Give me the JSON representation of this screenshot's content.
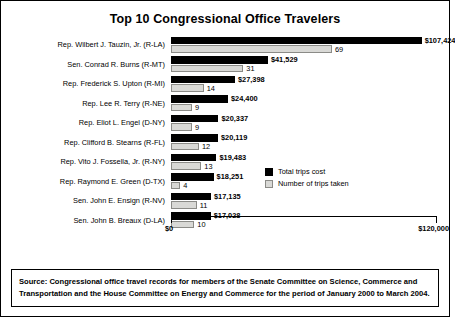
{
  "chart_data": {
    "type": "bar",
    "title": "Top 10 Congressional Office Travelers",
    "xlabel": "",
    "ylabel": "",
    "orientation": "horizontal",
    "xlim": [
      0,
      120000
    ],
    "grid": false,
    "legend_position": "inside-right",
    "axis_ticks": [
      "$0",
      "$120,000"
    ],
    "categories": [
      "Rep. Wilbert J. Tauzin, Jr. (R-LA)",
      "Sen. Conrad R. Burns (R-MT)",
      "Rep. Frederick S. Upton (R-MI)",
      "Rep. Lee R. Terry (R-NE)",
      "Rep. Eliot L. Engel (D-NY)",
      "Rep. Clifford B. Stearns (R-FL)",
      "Rep. Vito J. Fossella, Jr. (R-NY)",
      "Rep. Raymond E. Green (D-TX)",
      "Sen. John E. Ensign (R-NV)",
      "Sen. John B. Breaux (D-LA)"
    ],
    "series": [
      {
        "name": "Total trips cost",
        "color": "#000000",
        "values": [
          107424,
          41529,
          27398,
          24400,
          20337,
          20119,
          19483,
          18251,
          17135,
          17028
        ],
        "labels": [
          "$107,424",
          "$41,529",
          "$27,398",
          "$24,400",
          "$20,337",
          "$20,119",
          "$19,483",
          "$18,251",
          "$17,135",
          "$17,028"
        ]
      },
      {
        "name": "Number of trips taken",
        "color": "#d9d9d6",
        "values": [
          69,
          31,
          14,
          9,
          9,
          12,
          13,
          4,
          11,
          10
        ],
        "labels": [
          "69",
          "31",
          "14",
          "9",
          "9",
          "12",
          "13",
          "4",
          "11",
          "10"
        ]
      }
    ],
    "trips_scale_max": 120,
    "source": "Source: Congressional office travel records for members of the Senate Committee on Science, Commerce and Transportation and the House Committee on Energy and Commerce for the period of January 2000 to March 2004."
  }
}
